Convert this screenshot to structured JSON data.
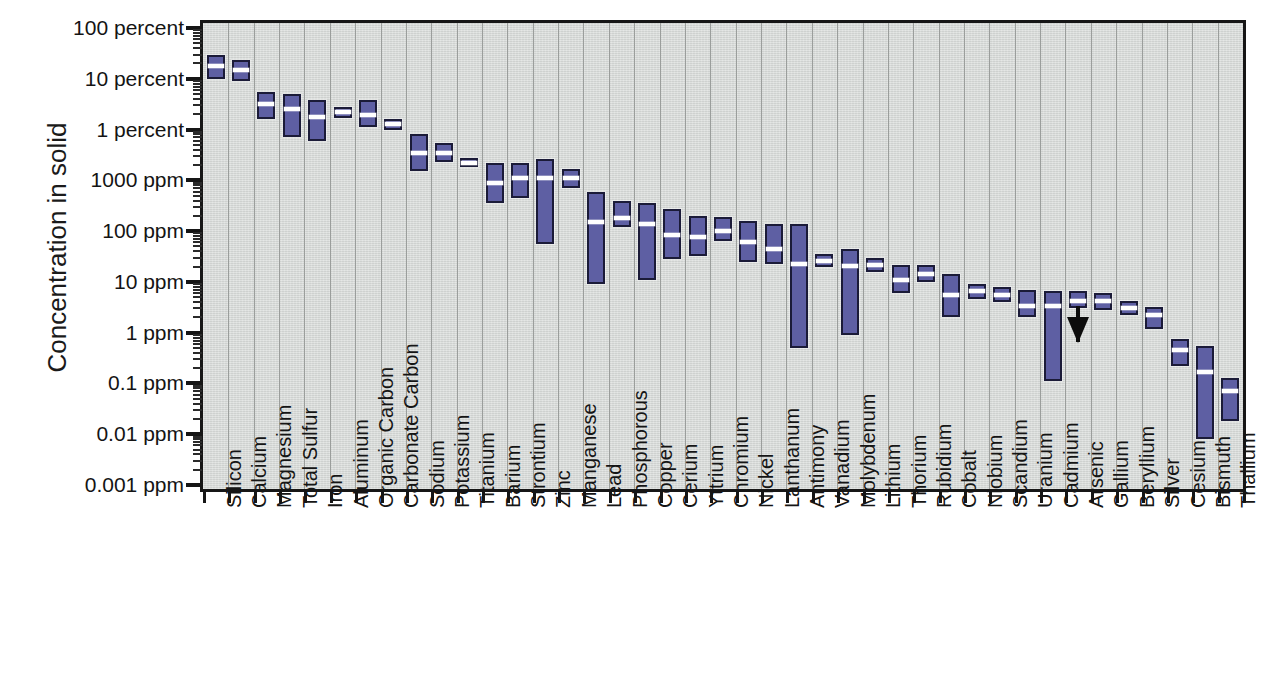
{
  "chart_data": {
    "type": "bar",
    "title": "",
    "subtitle": "",
    "xlabel": "",
    "ylabel": "Concentration in solid",
    "scale": "log10",
    "grid": "vertical gridlines between categories",
    "legend": null,
    "units_note": "Upper half of axis labeled in percent, lower half in ppm (1 percent = 10000 ppm)",
    "ylim_ppm": [
      0.001,
      1000000
    ],
    "ytick_labels": [
      "100 percent",
      "10 percent",
      "1 percent",
      "1000 ppm",
      "100 ppm",
      "10 ppm",
      "1 ppm",
      "0.1 ppm",
      "0.01 ppm",
      "0.001 ppm"
    ],
    "ytick_values_ppm": [
      1000000,
      100000,
      10000,
      1000,
      100,
      10,
      1,
      0.1,
      0.01,
      0.001
    ],
    "minor_ticks": true,
    "value_key": [
      "low",
      "median",
      "high"
    ],
    "value_units": "ppm",
    "categories": [
      "Silicon",
      "Calcium",
      "Magnesium",
      "Total Sulfur",
      "Iron",
      "Aluminum",
      "Organic Carbon",
      "Carbonate Carbon",
      "Sodium",
      "Potassium",
      "Titanium",
      "Barium",
      "Strontium",
      "Zinc",
      "Manganese",
      "Lead",
      "Phosphorous",
      "Copper",
      "Cerium",
      "Yttrium",
      "Chromium",
      "Nickel",
      "Lanthanum",
      "Antimony",
      "Vanadium",
      "Molybdenum",
      "Lithium",
      "Thorium",
      "Rubidium",
      "Cobalt",
      "Niobium",
      "Scandium",
      "Uranium",
      "Cadmium",
      "Arsenic",
      "Gallium",
      "Beryllium",
      "Silver",
      "Cesium",
      "Bismuth",
      "Thallium"
    ],
    "ranges": [
      {
        "name": "Silicon",
        "low": 100000,
        "median": 180000,
        "high": 300000
      },
      {
        "name": "Calcium",
        "low": 90000,
        "median": 150000,
        "high": 230000
      },
      {
        "name": "Magnesium",
        "low": 16000,
        "median": 32000,
        "high": 55000
      },
      {
        "name": "Total Sulfur",
        "low": 7000,
        "median": 25000,
        "high": 50000
      },
      {
        "name": "Iron",
        "low": 6000,
        "median": 18000,
        "high": 38000
      },
      {
        "name": "Aluminum",
        "low": 17000,
        "median": 22000,
        "high": 28000
      },
      {
        "name": "Organic Carbon",
        "low": 11000,
        "median": 19000,
        "high": 38000
      },
      {
        "name": "Carbonate Carbon",
        "low": 10000,
        "median": 13000,
        "high": 16000
      },
      {
        "name": "Sodium",
        "low": 1500,
        "median": 3500,
        "high": 8000
      },
      {
        "name": "Potassium",
        "low": 2300,
        "median": 3500,
        "high": 5500
      },
      {
        "name": "Titanium",
        "low": 1800,
        "median": 2200,
        "high": 2800
      },
      {
        "name": "Barium",
        "low": 350,
        "median": 900,
        "high": 2200
      },
      {
        "name": "Strontium",
        "low": 450,
        "median": 1100,
        "high": 2200
      },
      {
        "name": "Zinc",
        "low": 55,
        "median": 1100,
        "high": 2600
      },
      {
        "name": "Manganese",
        "low": 700,
        "median": 1100,
        "high": 1700
      },
      {
        "name": "Lead",
        "low": 9,
        "median": 150,
        "high": 600
      },
      {
        "name": "Phosphorous",
        "low": 120,
        "median": 180,
        "high": 400
      },
      {
        "name": "Copper",
        "low": 11,
        "median": 140,
        "high": 360
      },
      {
        "name": "Cerium",
        "low": 28,
        "median": 85,
        "high": 270
      },
      {
        "name": "Yttrium",
        "low": 33,
        "median": 75,
        "high": 200
      },
      {
        "name": "Chromium",
        "low": 65,
        "median": 100,
        "high": 190
      },
      {
        "name": "Nickel",
        "low": 25,
        "median": 60,
        "high": 160
      },
      {
        "name": "Lanthanum",
        "low": 22,
        "median": 45,
        "high": 140
      },
      {
        "name": "Antimony",
        "low": 0.5,
        "median": 23,
        "high": 140
      },
      {
        "name": "Vanadium",
        "low": 20,
        "median": 26,
        "high": 35
      },
      {
        "name": "Molybdenum",
        "low": 0.9,
        "median": 21,
        "high": 45
      },
      {
        "name": "Lithium",
        "low": 16,
        "median": 22,
        "high": 30
      },
      {
        "name": "Thorium",
        "low": 6,
        "median": 11,
        "high": 22
      },
      {
        "name": "Rubidium",
        "low": 10,
        "median": 14,
        "high": 22
      },
      {
        "name": "Cobalt",
        "low": 2,
        "median": 5.5,
        "high": 14
      },
      {
        "name": "Niobium",
        "low": 4.5,
        "median": 6.5,
        "high": 9
      },
      {
        "name": "Scandium",
        "low": 4,
        "median": 5.5,
        "high": 8
      },
      {
        "name": "Uranium",
        "low": 2,
        "median": 3.3,
        "high": 7
      },
      {
        "name": "Cadmium",
        "low": 0.11,
        "median": 3.3,
        "high": 6.5
      },
      {
        "name": "Arsenic",
        "low": 3,
        "median": 4.2,
        "high": 6.5
      },
      {
        "name": "Gallium",
        "low": 2.8,
        "median": 4.2,
        "high": 6
      },
      {
        "name": "Beryllium",
        "low": 2.2,
        "median": 3,
        "high": 4.2
      },
      {
        "name": "Silver",
        "low": 1.2,
        "median": 2.2,
        "high": 3.2
      },
      {
        "name": "Cesium",
        "low": 0.22,
        "median": 0.45,
        "high": 0.75
      },
      {
        "name": "Bismuth",
        "low": 0.008,
        "median": 0.17,
        "high": 0.55
      },
      {
        "name": "Thallium",
        "low": 0.018,
        "median": 0.07,
        "high": 0.13
      }
    ],
    "annotations": [
      {
        "type": "down-arrow",
        "category": "Arsenic",
        "note": "downward arrow below Arsenic bar indicating value may extend lower / below detection"
      }
    ],
    "colors": {
      "bar_fill": "#5e5fa3",
      "bar_outline": "#1b1b38",
      "median_line": "#ffffff",
      "plot_background": "#d9dcda",
      "gridline": "#9b9e9c",
      "axis": "#161616",
      "text": "#141414",
      "annotation": "#0c0c0c"
    }
  }
}
